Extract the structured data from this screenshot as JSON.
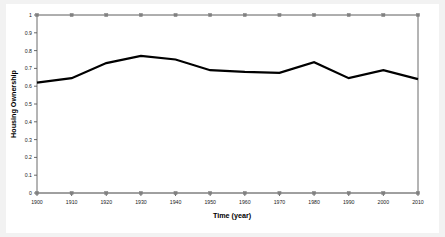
{
  "chart_data": {
    "type": "line",
    "title": "",
    "xlabel": "Time (year)",
    "ylabel": "Housing Ownership",
    "x": [
      1900,
      1910,
      1920,
      1930,
      1940,
      1950,
      1960,
      1970,
      1980,
      1990,
      2000,
      2010
    ],
    "xtick_labels": [
      "1900",
      "1910",
      "1920",
      "1930",
      "1940",
      "1950",
      "1960",
      "1970",
      "1980",
      "1990",
      "2000",
      "2010"
    ],
    "ytick_labels": [
      "0",
      "0.1",
      "0.2",
      "0.3",
      "0.4",
      "0.5",
      "0.6",
      "0.7",
      "0.8",
      "0.9",
      "1"
    ],
    "ytick_values": [
      0,
      0.1,
      0.2,
      0.3,
      0.4,
      0.5,
      0.6,
      0.7,
      0.8,
      0.9,
      1
    ],
    "xlim": [
      1900,
      2010
    ],
    "ylim": [
      0,
      1
    ],
    "grid": false,
    "legend": "none",
    "series": [
      {
        "name": "Housing Ownership",
        "color": "#000000",
        "line_width": 2.2,
        "markers": "none",
        "values": [
          0.62,
          0.645,
          0.73,
          0.77,
          0.75,
          0.69,
          0.68,
          0.675,
          0.735,
          0.645,
          0.69,
          0.64
        ]
      },
      {
        "name": "Upper bound",
        "color": "#808080",
        "line_width": 0.8,
        "markers": "square",
        "values": [
          1,
          1,
          1,
          1,
          1,
          1,
          1,
          1,
          1,
          1,
          1,
          1
        ]
      },
      {
        "name": "Lower bound",
        "color": "#808080",
        "line_width": 0.8,
        "markers": "square",
        "values": [
          0,
          0,
          0,
          0,
          0,
          0,
          0,
          0,
          0,
          0,
          0,
          0
        ]
      }
    ],
    "axis_color": "#595959",
    "plot_background": "#ffffff",
    "figure_background": "#f2f2f2"
  }
}
